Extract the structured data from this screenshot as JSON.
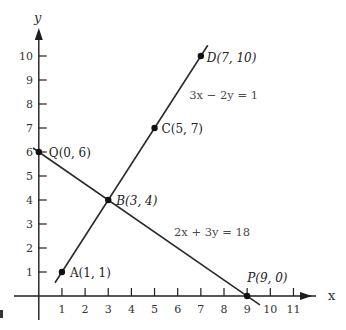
{
  "chart_data": {
    "type": "line",
    "title": "",
    "xlabel": "x",
    "ylabel": "y",
    "xlim": [
      -0.3,
      11.8
    ],
    "ylim": [
      -0.4,
      11.2
    ],
    "grid": false,
    "legend": "none",
    "x_ticks": [
      1,
      2,
      3,
      4,
      5,
      6,
      7,
      8,
      9,
      10,
      11
    ],
    "x_tick_labels": [
      "1",
      "2",
      "3",
      "4",
      "5",
      "6",
      "7",
      "8",
      "9",
      "10",
      "11"
    ],
    "y_ticks": [
      1,
      2,
      3,
      4,
      5,
      6,
      7,
      8,
      9,
      10
    ],
    "y_tick_labels": [
      "1",
      "2",
      "3",
      "4",
      "5",
      "6",
      "7",
      "8",
      "9",
      "10"
    ],
    "series": [
      {
        "name": "3x − 2y = 1",
        "x": [
          0.7,
          7.3
        ],
        "y": [
          0.55,
          10.45
        ],
        "label": "3x − 2y = 1",
        "label_at": [
          6.5,
          8.2
        ]
      },
      {
        "name": "2x + 3y = 18",
        "x": [
          -0.25,
          9.55
        ],
        "y": [
          6.167,
          -0.367
        ],
        "label": "2x + 3y = 18",
        "label_at": [
          5.84,
          2.5
        ]
      }
    ],
    "points": [
      {
        "name": "A",
        "label": "A(1, 1)",
        "x": 1,
        "y": 1,
        "dx": 8,
        "dy": 5,
        "italic_letter": false
      },
      {
        "name": "B",
        "label": "B(3, 4)",
        "x": 3,
        "y": 4,
        "dx": 8,
        "dy": 5,
        "italic_letter": true
      },
      {
        "name": "C",
        "label": "C(5, 7)",
        "x": 5,
        "y": 7,
        "dx": 7,
        "dy": 5,
        "italic_letter": false
      },
      {
        "name": "D",
        "label": "D(7, 10)",
        "x": 7,
        "y": 10,
        "dx": 6,
        "dy": 6,
        "italic_letter": true
      },
      {
        "name": "Q",
        "label": "Q(0, 6)",
        "x": 0,
        "y": 6,
        "dx": 10,
        "dy": 5,
        "italic_letter": false
      },
      {
        "name": "P",
        "label": "P(9, 0)",
        "x": 9,
        "y": 0,
        "dx": 0,
        "dy": -14,
        "italic_letter": true
      }
    ],
    "annotations": [
      "3x − 2y = 1",
      "2x + 3y = 18"
    ]
  },
  "colors": {
    "background": "#ffffff",
    "ink": "#1e1e1e"
  }
}
